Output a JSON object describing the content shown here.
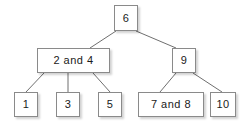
{
  "diagram": {
    "background_color": "#ffffff",
    "node_fill": "#ffffff",
    "node_border": "#8a8a8a",
    "edge_color": "#6f6f6f",
    "text_color": "#1a1a1a",
    "nodes": [
      {
        "id": "root",
        "label": "6",
        "x": 114,
        "y": 5,
        "w": 24,
        "h": 26
      },
      {
        "id": "left",
        "label": "2  and  4",
        "x": 37,
        "y": 48,
        "w": 73,
        "h": 25
      },
      {
        "id": "right",
        "label": "9",
        "x": 172,
        "y": 48,
        "w": 24,
        "h": 25
      },
      {
        "id": "leaf1",
        "label": "1",
        "x": 14,
        "y": 92,
        "w": 24,
        "h": 25
      },
      {
        "id": "leaf3",
        "label": "3",
        "x": 56,
        "y": 92,
        "w": 24,
        "h": 25
      },
      {
        "id": "leaf5",
        "label": "5",
        "x": 98,
        "y": 92,
        "w": 24,
        "h": 25
      },
      {
        "id": "leaf78",
        "label": "7  and  8",
        "x": 138,
        "y": 92,
        "w": 66,
        "h": 25
      },
      {
        "id": "leaf10",
        "label": "10",
        "x": 210,
        "y": 92,
        "w": 26,
        "h": 25
      }
    ],
    "edges": [
      {
        "id": "root-left",
        "x1": 116,
        "y1": 31,
        "x2": 90,
        "y2": 48
      },
      {
        "id": "root-right",
        "x1": 136,
        "y1": 31,
        "x2": 176,
        "y2": 48
      },
      {
        "id": "left-leaf1",
        "x1": 44,
        "y1": 73,
        "x2": 26,
        "y2": 92
      },
      {
        "id": "left-leaf3",
        "x1": 68,
        "y1": 73,
        "x2": 68,
        "y2": 92
      },
      {
        "id": "left-leaf5",
        "x1": 93,
        "y1": 73,
        "x2": 110,
        "y2": 92
      },
      {
        "id": "right-leaf78",
        "x1": 176,
        "y1": 73,
        "x2": 160,
        "y2": 92
      },
      {
        "id": "right-leaf10",
        "x1": 193,
        "y1": 73,
        "x2": 222,
        "y2": 92
      }
    ]
  }
}
